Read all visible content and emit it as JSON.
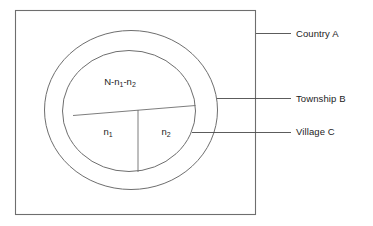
{
  "diagram": {
    "type": "nested-set-diagram",
    "shapes": {
      "country_rect": {
        "x": 15,
        "y": 10,
        "width": 241,
        "height": 205
      },
      "township_circle": {
        "cx": 131,
        "cy": 110,
        "rx": 87,
        "ry": 80
      },
      "village_circle": {
        "cx": 129,
        "cy": 111,
        "rx": 67,
        "ry": 61
      },
      "chord_line": {
        "x1": 74,
        "y1": 115,
        "x2": 196,
        "y2": 106
      },
      "vertical_divider": {
        "x1": 138,
        "y1": 110,
        "x2": 138,
        "y2": 172
      }
    },
    "callouts": [
      {
        "id": "country-a",
        "label": "Country A",
        "leader": {
          "x1": 256,
          "y1": 33,
          "x2": 290,
          "y2": 33
        }
      },
      {
        "id": "township-b",
        "label": "Township B",
        "leader": {
          "x1": 217,
          "y1": 98,
          "x2": 290,
          "y2": 98
        }
      },
      {
        "id": "village-c",
        "label": "Village C",
        "leader": {
          "x1": 193,
          "y1": 132,
          "x2": 290,
          "y2": 132
        }
      }
    ],
    "regions": {
      "remainder": {
        "text_prefix": "N-n",
        "sub1": "1",
        "text_middle": "-n",
        "sub2": "2",
        "plain": "N-n1-n2"
      },
      "segment_1": {
        "base": "n",
        "sub": "1",
        "plain": "n1"
      },
      "segment_2": {
        "base": "n",
        "sub": "2",
        "plain": "n2"
      }
    },
    "colors": {
      "stroke": "#6e6e6e",
      "leader_stroke": "#4a4a4a",
      "text": "#1c1c1c",
      "background": "#ffffff"
    }
  }
}
